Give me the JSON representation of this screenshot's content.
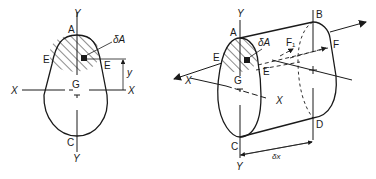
{
  "figure_left": {
    "title": "Cross-section",
    "labels": {
      "y_top": "Y",
      "y_bottom": "Y",
      "x_left": "X",
      "x_right": "X",
      "point_a": "A",
      "point_c": "C",
      "point_e_left": "E",
      "point_e_right": "E",
      "point_g": "G",
      "element_area": "δA",
      "distance_y": "y"
    }
  },
  "figure_right": {
    "title": "Beam element",
    "labels": {
      "y_top": "Y",
      "y_bottom": "Y",
      "x_left": "X",
      "x_right": "X",
      "point_a": "A",
      "point_b": "B",
      "point_c": "C",
      "point_d": "D",
      "point_e_left": "E",
      "point_e_right": "E",
      "point_f": "F",
      "point_f1": "F₁",
      "point_g": "G",
      "element_area": "δA",
      "length": "δx"
    }
  },
  "colors": {
    "ink": "#1a1a1a",
    "background": "#ffffff"
  }
}
